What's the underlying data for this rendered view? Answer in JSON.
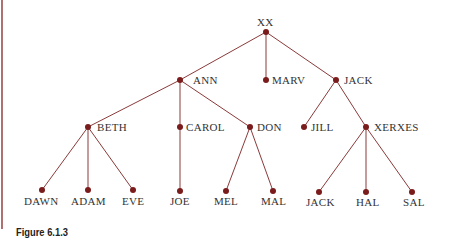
{
  "caption": "Figure 6.1.3",
  "colors": {
    "edge": "#8b3a3a",
    "node": "#7a1c1c",
    "rule": "#b07070"
  },
  "nodes": {
    "xx": "XX",
    "ann": "ANN",
    "marv": "MARV",
    "jack": "JACK",
    "beth": "BETH",
    "carol": "CAROL",
    "don": "DON",
    "jill": "JILL",
    "xerxes": "XERXES",
    "dawn": "DAWN",
    "adam": "ADAM",
    "eve": "EVE",
    "joe": "JOE",
    "mel": "MEL",
    "mal": "MAL",
    "jack2": "JACK",
    "hal": "HAL",
    "sal": "SAL"
  },
  "edges": [
    [
      "XX",
      "ANN"
    ],
    [
      "XX",
      "MARV"
    ],
    [
      "XX",
      "JACK"
    ],
    [
      "ANN",
      "BETH"
    ],
    [
      "ANN",
      "CAROL"
    ],
    [
      "ANN",
      "DON"
    ],
    [
      "JACK",
      "JILL"
    ],
    [
      "JACK",
      "XERXES"
    ],
    [
      "BETH",
      "DAWN"
    ],
    [
      "BETH",
      "ADAM"
    ],
    [
      "BETH",
      "EVE"
    ],
    [
      "CAROL",
      "JOE"
    ],
    [
      "DON",
      "MEL"
    ],
    [
      "DON",
      "MAL"
    ],
    [
      "XERXES",
      "JACK"
    ],
    [
      "XERXES",
      "HAL"
    ],
    [
      "XERXES",
      "SAL"
    ]
  ]
}
